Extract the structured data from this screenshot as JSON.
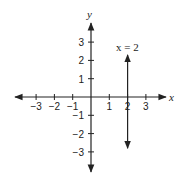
{
  "diagram": {
    "type": "coordinate-plane",
    "x_axis_label": "x",
    "y_axis_label": "y",
    "x_ticks": [
      {
        "label": "−3",
        "value": -3
      },
      {
        "label": "−2",
        "value": -2
      },
      {
        "label": "−1",
        "value": -1
      },
      {
        "label": "1",
        "value": 1
      },
      {
        "label": "2",
        "value": 2
      },
      {
        "label": "3",
        "value": 3
      }
    ],
    "y_ticks": [
      {
        "label": "3",
        "value": 3
      },
      {
        "label": "2",
        "value": 2
      },
      {
        "label": "1",
        "value": 1
      },
      {
        "label": "−1",
        "value": -1
      },
      {
        "label": "−2",
        "value": -2
      },
      {
        "label": "−3",
        "value": -3
      }
    ],
    "line": {
      "equation_label": "x = 2",
      "x_value": 2,
      "y_from": -2.8,
      "y_to": 2.3
    },
    "colors": {
      "stroke": "#222222",
      "background": "#ffffff"
    }
  }
}
